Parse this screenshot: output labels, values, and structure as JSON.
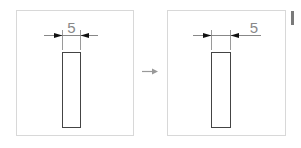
{
  "diagram": {
    "panels": [
      {
        "id": "before",
        "dimension_value": "5",
        "text_position": "centered-above"
      },
      {
        "id": "after",
        "dimension_value": "5",
        "text_position": "offset-right"
      }
    ],
    "transition_arrow": "right-arrow",
    "colors": {
      "panel_border": "#d8d8d8",
      "shape_stroke": "#444444",
      "dimension_line": "#888888",
      "arrowhead": "#111111",
      "text": "#888888"
    }
  }
}
